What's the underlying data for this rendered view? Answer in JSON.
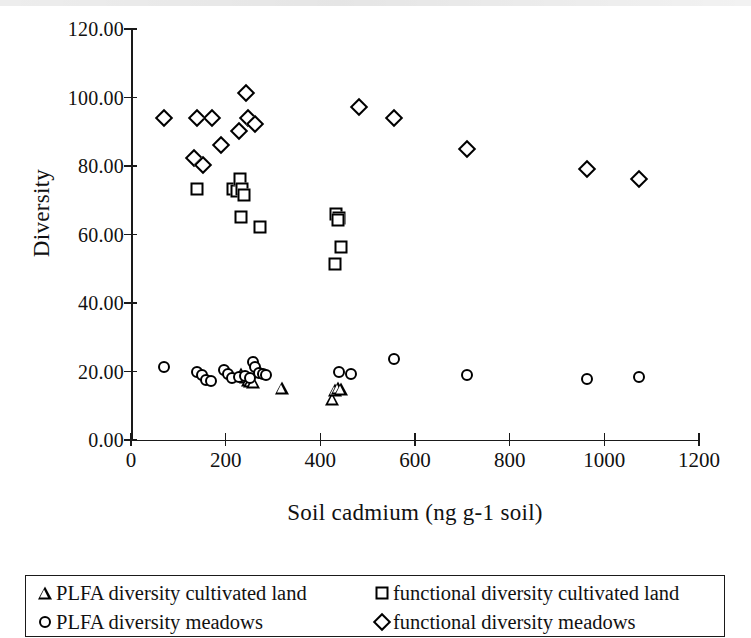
{
  "chart_data": {
    "type": "scatter",
    "title": "",
    "xlabel": "Soil cadmium (ng g-1 soil)",
    "ylabel": "Diversity",
    "xlim": [
      0,
      1200
    ],
    "ylim": [
      0,
      120
    ],
    "xticks": [
      "0",
      "200",
      "400",
      "600",
      "800",
      "1000",
      "1200"
    ],
    "xtick_values": [
      0,
      200,
      400,
      600,
      800,
      1000,
      1200
    ],
    "yticks": [
      "0.00",
      "20.00",
      "40.00",
      "60.00",
      "80.00",
      "100.00",
      "120.00"
    ],
    "ytick_values": [
      0,
      20,
      40,
      60,
      80,
      100,
      120
    ],
    "grid": false,
    "legend_position": "below",
    "series": [
      {
        "name": "PLFA diversity cultivated land",
        "marker": "triangle",
        "color": "#000000",
        "points": [
          [
            233,
            19.2
          ],
          [
            242,
            18.3
          ],
          [
            248,
            17.6
          ],
          [
            252,
            17.3
          ],
          [
            258,
            16.9
          ],
          [
            318,
            15.3
          ],
          [
            425,
            12.0
          ],
          [
            430,
            14.6
          ],
          [
            437,
            15.2
          ],
          [
            443,
            14.8
          ]
        ]
      },
      {
        "name": "PLFA diversity meadows",
        "marker": "circle",
        "color": "#000000",
        "points": [
          [
            70,
            21.2
          ],
          [
            140,
            19.8
          ],
          [
            150,
            19.0
          ],
          [
            158,
            17.5
          ],
          [
            168,
            17.1
          ],
          [
            196,
            20.3
          ],
          [
            205,
            19.2
          ],
          [
            213,
            18.2
          ],
          [
            228,
            18.4
          ],
          [
            240,
            18.8
          ],
          [
            252,
            18.0
          ],
          [
            258,
            22.8
          ],
          [
            262,
            21.3
          ],
          [
            270,
            19.6
          ],
          [
            278,
            19.3
          ],
          [
            286,
            19.0
          ],
          [
            440,
            20.0
          ],
          [
            464,
            19.4
          ],
          [
            556,
            23.6
          ],
          [
            710,
            19.0
          ],
          [
            963,
            17.9
          ],
          [
            1073,
            18.5
          ]
        ]
      },
      {
        "name": "functional diversity cultivated land",
        "marker": "square",
        "color": "#000000",
        "points": [
          [
            140,
            73.2
          ],
          [
            216,
            73.4
          ],
          [
            224,
            72.8
          ],
          [
            231,
            76.2
          ],
          [
            234,
            73.4
          ],
          [
            238,
            71.6
          ],
          [
            232,
            65.2
          ],
          [
            272,
            62.2
          ],
          [
            434,
            66.0
          ],
          [
            440,
            64.8
          ],
          [
            437,
            64.2
          ],
          [
            444,
            56.3
          ],
          [
            430,
            51.4
          ]
        ]
      },
      {
        "name": "functional diversity meadows",
        "marker": "diamond",
        "color": "#000000",
        "points": [
          [
            70,
            94.0
          ],
          [
            134,
            82.3
          ],
          [
            140,
            94.0
          ],
          [
            152,
            80.2
          ],
          [
            172,
            94.0
          ],
          [
            190,
            86.2
          ],
          [
            228,
            90.3
          ],
          [
            243,
            101.3
          ],
          [
            248,
            94.0
          ],
          [
            262,
            92.3
          ],
          [
            482,
            97.2
          ],
          [
            556,
            94.0
          ],
          [
            710,
            85.0
          ],
          [
            963,
            79.1
          ],
          [
            1073,
            76.2
          ]
        ]
      }
    ]
  },
  "axes": {
    "y_title": "Diversity",
    "x_title": "Soil cadmium (ng g-1 soil)"
  },
  "legend": {
    "items": [
      {
        "label": "PLFA diversity cultivated land",
        "marker": "triangle-icon"
      },
      {
        "label": "PLFA diversity meadows",
        "marker": "circle-icon"
      },
      {
        "label": "functional diversity cultivated land",
        "marker": "square-icon"
      },
      {
        "label": "functional diversity meadows",
        "marker": "diamond-icon"
      }
    ]
  }
}
